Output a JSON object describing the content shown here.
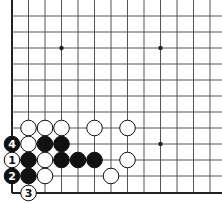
{
  "diagram": {
    "type": "go-board-fragment",
    "view": "lower-left corner",
    "colors": {
      "background": "#ffffff",
      "line": "#555555",
      "edge": "#222222",
      "black": "#111111",
      "white": "#ffffff"
    },
    "grid": {
      "columns_x": [
        12,
        28.5,
        45,
        61.5,
        78,
        94.5,
        111,
        127.5,
        144,
        160.5,
        177,
        193.5,
        210
      ],
      "rows_y": [
        16,
        32,
        48,
        64,
        80,
        96,
        112,
        128,
        144,
        160,
        176,
        193
      ],
      "left_edge": true,
      "bottom_edge": true
    },
    "hoshi": [
      {
        "col": 3,
        "row": 2
      },
      {
        "col": 9,
        "row": 2
      },
      {
        "col": 9,
        "row": 8
      }
    ],
    "stones": [
      {
        "color": "white",
        "col": 1,
        "row": 7,
        "label": ""
      },
      {
        "color": "white",
        "col": 2,
        "row": 7,
        "label": ""
      },
      {
        "color": "white",
        "col": 3,
        "row": 7,
        "label": ""
      },
      {
        "color": "white",
        "col": 5,
        "row": 7,
        "label": ""
      },
      {
        "color": "white",
        "col": 7,
        "row": 7,
        "label": ""
      },
      {
        "color": "black",
        "col": 0,
        "row": 8,
        "label": "4"
      },
      {
        "color": "white",
        "col": 1,
        "row": 8,
        "label": ""
      },
      {
        "color": "black",
        "col": 2,
        "row": 8,
        "label": ""
      },
      {
        "color": "black",
        "col": 3,
        "row": 8,
        "label": ""
      },
      {
        "color": "white",
        "col": 0,
        "row": 9,
        "label": "1"
      },
      {
        "color": "black",
        "col": 1,
        "row": 9,
        "label": ""
      },
      {
        "color": "white",
        "col": 2,
        "row": 9,
        "label": ""
      },
      {
        "color": "black",
        "col": 3,
        "row": 9,
        "label": ""
      },
      {
        "color": "black",
        "col": 4,
        "row": 9,
        "label": ""
      },
      {
        "color": "black",
        "col": 5,
        "row": 9,
        "label": ""
      },
      {
        "color": "white",
        "col": 7,
        "row": 9,
        "label": ""
      },
      {
        "color": "black",
        "col": 0,
        "row": 10,
        "label": "2"
      },
      {
        "color": "black",
        "col": 1,
        "row": 10,
        "label": ""
      },
      {
        "color": "white",
        "col": 2,
        "row": 10,
        "label": ""
      },
      {
        "color": "white",
        "col": 6,
        "row": 10,
        "label": ""
      },
      {
        "color": "white",
        "col": 1,
        "row": 11,
        "label": "3"
      }
    ]
  }
}
